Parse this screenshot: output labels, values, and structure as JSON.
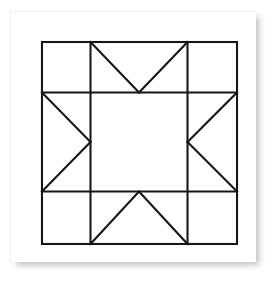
{
  "page": {
    "background_color": "#ffffff"
  },
  "card": {
    "name": "paper-card",
    "fill_color": "#ffffff",
    "shadow_color": "#a9a9a9"
  },
  "diagram": {
    "name": "sawtooth-star-quilt-block",
    "type": "line-drawing",
    "pattern_name": "Sawtooth Star",
    "line_color": "#161616",
    "fill_color": "#ffffff",
    "stroke_width": 2.1,
    "grid": {
      "columns": 3,
      "rows": 3,
      "x_divisions": [
        0,
        49,
        147,
        197
      ],
      "y_divisions": [
        0,
        51,
        151,
        204
      ]
    },
    "outer_square": {
      "name": "block-border",
      "x": 0,
      "y": 0,
      "width": 197,
      "height": 204
    },
    "grid_lines": [
      {
        "name": "vertical-grid-line-1",
        "x1": 49,
        "y1": 0,
        "x2": 49,
        "y2": 204
      },
      {
        "name": "vertical-grid-line-2",
        "x1": 147,
        "y1": 0,
        "x2": 147,
        "y2": 204
      },
      {
        "name": "horizontal-grid-line-1",
        "x1": 0,
        "y1": 51,
        "x2": 197,
        "y2": 51
      },
      {
        "name": "horizontal-grid-line-2",
        "x1": 0,
        "y1": 151,
        "x2": 197,
        "y2": 151
      }
    ],
    "cells": [
      {
        "name": "corner-patch-top-left",
        "row": 0,
        "col": 0,
        "shape": "plain-square"
      },
      {
        "name": "flying-geese-top",
        "row": 0,
        "col": 1,
        "shape": "triangle-pointing-down"
      },
      {
        "name": "corner-patch-top-right",
        "row": 0,
        "col": 2,
        "shape": "plain-square"
      },
      {
        "name": "flying-geese-left",
        "row": 1,
        "col": 0,
        "shape": "triangle-pointing-right"
      },
      {
        "name": "center-patch",
        "row": 1,
        "col": 1,
        "shape": "plain-square"
      },
      {
        "name": "flying-geese-right",
        "row": 1,
        "col": 2,
        "shape": "triangle-pointing-left"
      },
      {
        "name": "corner-patch-bottom-left",
        "row": 2,
        "col": 0,
        "shape": "plain-square"
      },
      {
        "name": "flying-geese-bottom",
        "row": 2,
        "col": 1,
        "shape": "triangle-pointing-up"
      },
      {
        "name": "corner-patch-bottom-right",
        "row": 2,
        "col": 2,
        "shape": "plain-square"
      }
    ],
    "diagonals": [
      {
        "name": "diagonal-top-left-of-geese-top",
        "x1": 49,
        "y1": 0,
        "x2": 98,
        "y2": 51
      },
      {
        "name": "diagonal-top-right-of-geese-top",
        "x1": 147,
        "y1": 0,
        "x2": 98,
        "y2": 51
      },
      {
        "name": "diagonal-upper-of-geese-left",
        "x1": 0,
        "y1": 51,
        "x2": 49,
        "y2": 101
      },
      {
        "name": "diagonal-lower-of-geese-left",
        "x1": 0,
        "y1": 151,
        "x2": 49,
        "y2": 101
      },
      {
        "name": "diagonal-upper-of-geese-right",
        "x1": 197,
        "y1": 51,
        "x2": 147,
        "y2": 101
      },
      {
        "name": "diagonal-lower-of-geese-right",
        "x1": 197,
        "y1": 151,
        "x2": 147,
        "y2": 101
      },
      {
        "name": "diagonal-bottom-left-of-geese-bottom",
        "x1": 49,
        "y1": 204,
        "x2": 98,
        "y2": 151
      },
      {
        "name": "diagonal-bottom-right-of-geese-bottom",
        "x1": 147,
        "y1": 204,
        "x2": 98,
        "y2": 151
      }
    ]
  }
}
